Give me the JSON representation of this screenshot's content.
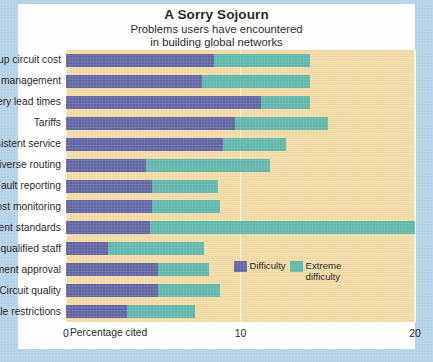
{
  "chart_data": {
    "type": "bar",
    "orientation": "horizontal",
    "stacked": true,
    "title": "A Sorry Sojourn",
    "subtitle_line1": "Problems users have encountered",
    "subtitle_line2": "in building global networks",
    "xlabel": "Percentage cited",
    "ylabel": "",
    "xlim": [
      0,
      20
    ],
    "xticks": [
      0,
      10,
      20
    ],
    "xtick_labels": [
      "0",
      "10",
      "20"
    ],
    "grid": true,
    "legend_position": "inside-bottom-right",
    "categories": [
      "Backup circuit cost",
      "No end-to-end management",
      "Delivery lead times",
      "Tariffs",
      "Inconsistent service",
      "No diverse routing",
      "Fault reporting",
      "Cost monitoring",
      "Inconsistent standards",
      "Lack of qualified staff",
      "Equipment approval",
      "Circuit quality",
      "Resale restrictions"
    ],
    "series": [
      {
        "name": "Difficulty",
        "color": "#6164a2",
        "values": [
          8.5,
          7.8,
          11.2,
          9.7,
          9.0,
          4.6,
          4.9,
          4.9,
          4.8,
          2.4,
          5.3,
          5.3,
          3.5
        ]
      },
      {
        "name": "Extreme difficulty",
        "color": "#5fb6a9",
        "values": [
          5.5,
          6.2,
          2.8,
          5.3,
          3.6,
          7.1,
          3.8,
          3.9,
          15.2,
          5.5,
          2.9,
          3.5,
          3.9
        ]
      }
    ],
    "totals": [
      14.0,
      14.0,
      14.0,
      15.0,
      12.6,
      11.7,
      8.7,
      8.8,
      20.0,
      7.9,
      8.2,
      8.8,
      7.4
    ]
  },
  "legend": {
    "items": [
      {
        "label": "Difficulty",
        "color": "#6164a2"
      },
      {
        "label": "Extreme\ndifficulty",
        "color": "#5fb6a9"
      }
    ]
  },
  "colors": {
    "plot_background": "#f2daa3",
    "card_background": "#fdfdfb",
    "page_border": "#b3d1e6",
    "gridline": "#fdf6e4",
    "text": "#1a1a1a",
    "difficulty": "#6164a2",
    "extreme_difficulty": "#5fb6a9"
  }
}
